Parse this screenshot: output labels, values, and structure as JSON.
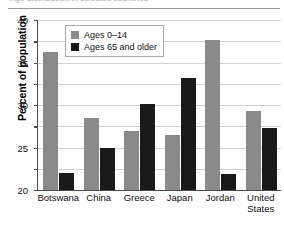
{
  "caption": {
    "cutoff_text": "Age distribution in selected countries"
  },
  "legend": {
    "position": "top-left-inside",
    "entries": [
      {
        "label": "Ages 0–14",
        "color": "#8a8a8a",
        "swatch_name": "legend-swatch-young"
      },
      {
        "label": "Ages 65 and older",
        "color": "#1a1a1a",
        "swatch_name": "legend-swatch-old"
      }
    ]
  },
  "axes": {
    "ylabel": "Percent of population",
    "yticks": [
      "0",
      "5",
      "10",
      "15",
      "20",
      "25",
      "30",
      "35",
      "40"
    ],
    "xlabel": ""
  },
  "chart_data": {
    "type": "bar",
    "title": "",
    "subtitle": "",
    "xlabel": "",
    "ylabel": "Percent of population",
    "ylim": [
      0,
      40
    ],
    "ytick_step": 5,
    "yticks": [
      0,
      5,
      10,
      15,
      20,
      25,
      30,
      35,
      40
    ],
    "grid": true,
    "grid_axis": "y",
    "legend_position": "upper left (inside plot)",
    "categories": [
      "Botswana",
      "China",
      "Greece",
      "Japan",
      "Jordan",
      "United States"
    ],
    "category_labels_multiline": [
      "Botswana",
      "China",
      "Greece",
      "Japan",
      "Jordan",
      "United\nStates"
    ],
    "series": [
      {
        "name": "Ages 0–14",
        "color": "#8a8a8a",
        "values": [
          32.5,
          17.0,
          13.9,
          12.9,
          35.3,
          18.7
        ]
      },
      {
        "name": "Ages 65 and older",
        "color": "#1a1a1a",
        "values": [
          4.0,
          10.0,
          20.3,
          26.4,
          3.7,
          14.6
        ]
      }
    ]
  }
}
